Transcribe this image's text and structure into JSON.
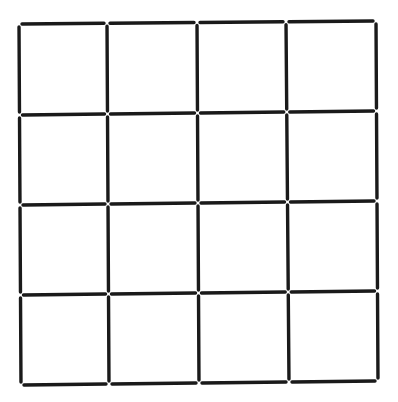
{
  "diagram": {
    "rows": 4,
    "cols": 4,
    "stick_color": "#1a1a1a",
    "background": "#ffffff",
    "grid_x_top": [
      19,
      107,
      197,
      286,
      376
    ],
    "grid_x_bottom": [
      21,
      109,
      199,
      289,
      378
    ],
    "grid_y_left": [
      24,
      115,
      205,
      295,
      385
    ],
    "grid_y_right": [
      21,
      111,
      201,
      291,
      381
    ],
    "gap": 3
  }
}
